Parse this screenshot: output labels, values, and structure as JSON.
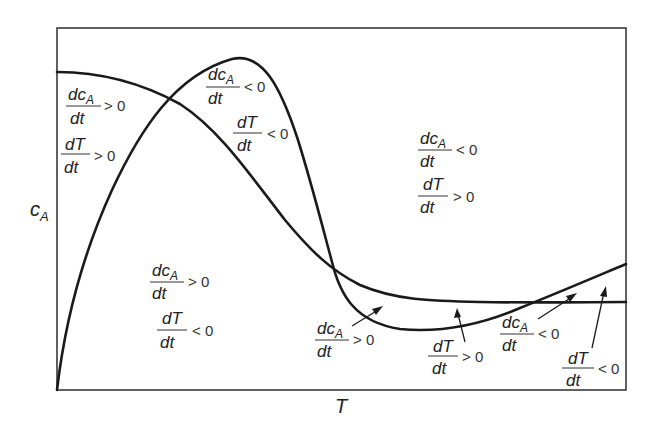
{
  "diagram": {
    "axes": {
      "x_label": "T",
      "y_label_main": "c",
      "y_label_sub": "A"
    },
    "curves": [
      {
        "name": "dT/dt = 0 nullcline",
        "description": "rises from origin, peaks, falls steeply, then minimum and rises again"
      },
      {
        "name": "dcA/dt = 0 nullcline",
        "description": "starts high at left, decreases through middle, levels off flat"
      }
    ],
    "regions": [
      {
        "id": "upper-left",
        "num1": "dc",
        "num1_sub": "A",
        "den1": "dt",
        "rel1": "> 0",
        "num2": "dT",
        "den2": "dt",
        "rel2": "> 0"
      },
      {
        "id": "peak",
        "num1": "dc",
        "num1_sub": "A",
        "den1": "dt",
        "rel1": "< 0",
        "num2": "dT",
        "den2": "dt",
        "rel2": "< 0"
      },
      {
        "id": "upper-right",
        "num1": "dc",
        "num1_sub": "A",
        "den1": "dt",
        "rel1": "< 0",
        "num2": "dT",
        "den2": "dt",
        "rel2": "> 0"
      },
      {
        "id": "lower-left",
        "num1": "dc",
        "num1_sub": "A",
        "den1": "dt",
        "rel1": "> 0",
        "num2": "dT",
        "den2": "dt",
        "rel2": "< 0"
      }
    ],
    "callouts": [
      {
        "id": "lower-mid-dca",
        "num": "dc",
        "num_sub": "A",
        "den": "dt",
        "rel": "> 0"
      },
      {
        "id": "lower-mid-dT",
        "num": "dT",
        "num_sub": "",
        "den": "dt",
        "rel": "> 0"
      },
      {
        "id": "lower-right-dca",
        "num": "dc",
        "num_sub": "A",
        "den": "dt",
        "rel": "< 0"
      },
      {
        "id": "lower-right-dT",
        "num": "dT",
        "num_sub": "",
        "den": "dt",
        "rel": "< 0"
      }
    ]
  }
}
